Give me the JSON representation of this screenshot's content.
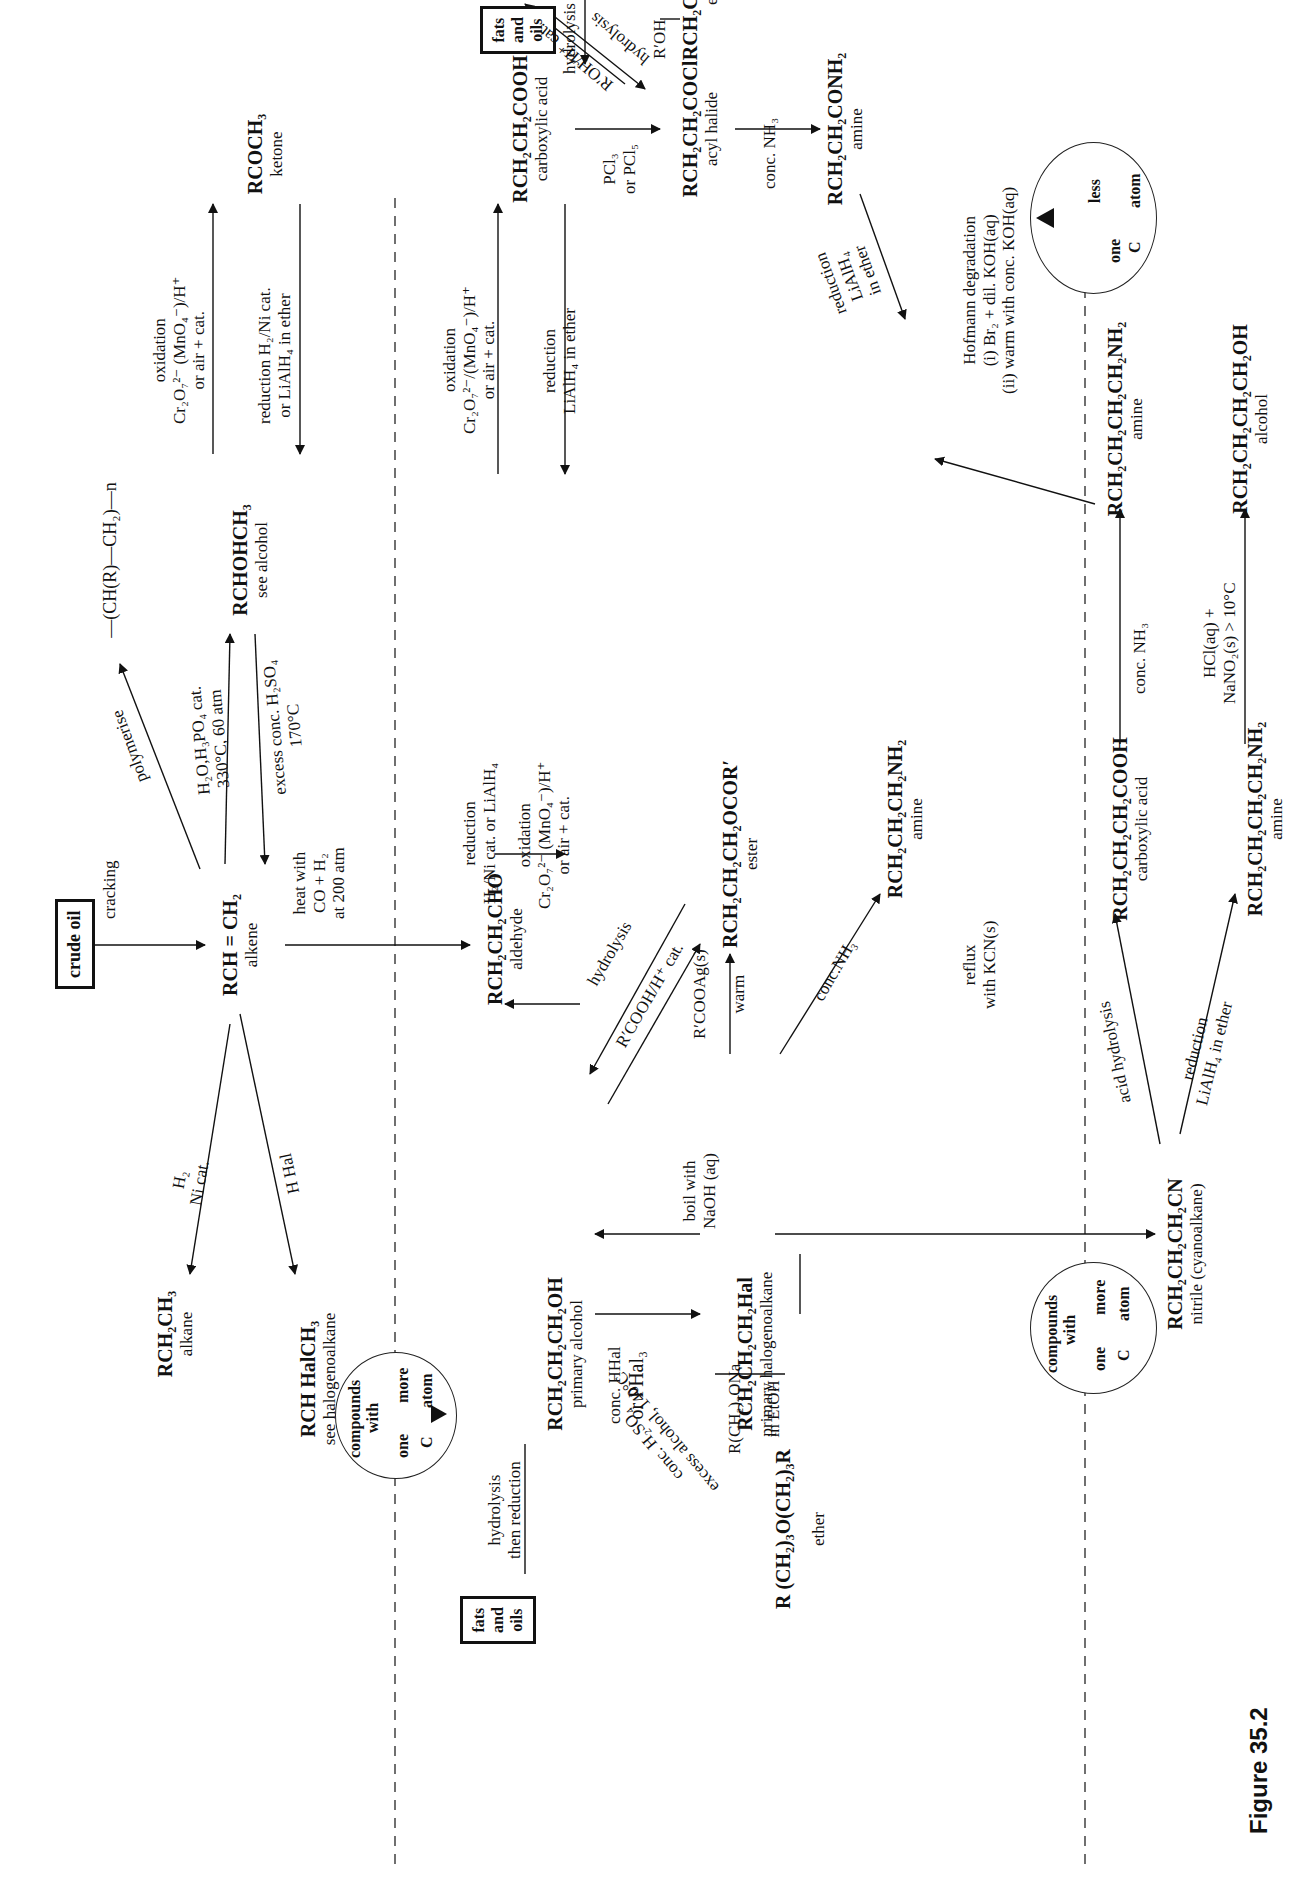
{
  "figure": {
    "caption": "Figure 35.2",
    "legend_more": {
      "top": "compounds",
      "mid": "with",
      "one": "one",
      "more": "more",
      "c": "C",
      "atom": "atom"
    },
    "legend_less": {
      "one": "one",
      "less": "less",
      "c": "C",
      "atom": "atom"
    },
    "boxes": {
      "crude_oil": "crude oil",
      "fats_oils_top": [
        "fats",
        "and",
        "oils"
      ],
      "fats_oils_bottom": [
        "fats",
        "and",
        "oils"
      ]
    }
  },
  "compounds": {
    "alkene": {
      "formula": "RCH = CH₂",
      "class": "alkene"
    },
    "polymer": {
      "formula": "—(CH(R)—CH₂)—n"
    },
    "sec_alcohol": {
      "formula": "RCHOHCH₃",
      "class": "see alcohol"
    },
    "ketone": {
      "formula": "RCOCH₃",
      "class": "ketone"
    },
    "alkane": {
      "formula": "RCH₂CH₃",
      "class": "alkane"
    },
    "halo_sec": {
      "formula": "RCH HalCH₃",
      "class": "see halogenoalkane"
    },
    "aldehyde": {
      "formula": "RCH₂CH₂CHO",
      "class": "aldehyde"
    },
    "carboxylic_acid": {
      "formula": "RCH₂CH₂COOH",
      "class": "carboxylic acid"
    },
    "ester_top": {
      "formula": "RCH₂CH₂CO₂R′",
      "class": "ester"
    },
    "acyl_halide": {
      "formula": "RCH₂CH₂COCl",
      "class": "acyl halide"
    },
    "amide": {
      "formula": "RCH₂CH₂CONH₂",
      "class": "amine"
    },
    "primary_alcohol": {
      "formula": "RCH₂CH₂CH₂OH",
      "class": "primary alcohol"
    },
    "ester_mid": {
      "formula": "RCH₂CH₂CH₂OCOR′",
      "class": "ester"
    },
    "amine_mid": {
      "formula": "RCH₂CH₂CH₂NH₂",
      "class": "amine"
    },
    "halogenoalkane": {
      "formula": "RCH₂CH₂CH₂Hal",
      "class": "primary halogenoalkane"
    },
    "ether": {
      "formula": "R (CH₂)₃O(CH₂)₃R",
      "class": "ether"
    },
    "nitrile": {
      "formula": "RCH₂CH₂CH₂CN",
      "class": "nitrile (cyanoalkane)"
    },
    "acid_low": {
      "formula": "RCH₂CH₂CH₂COOH",
      "class": "carboxylic acid"
    },
    "amine_low": {
      "formula": "RCH₂CH₂CH₂CH₂NH₂",
      "class": "amine"
    },
    "amine_top_right": {
      "formula": "RCH₂CH₂CH₂CH₂NH₂",
      "class": "amine"
    },
    "alcohol_top_right": {
      "formula": "RCH₂CH₂CH₂CH₂OH",
      "class": "alcohol"
    }
  },
  "reactions": {
    "cracking": "cracking",
    "polymerise": "polymerise",
    "hydration": [
      "H₂O,H₃PO₄ cat.",
      "330°C, 60 atm"
    ],
    "dehydration": [
      "excess conc. H₂SO₄",
      "170°C"
    ],
    "ketone_ox": [
      "oxidation",
      "Cr₂O₇²⁻ (MnO₄⁻)/H⁺",
      "or air + cat."
    ],
    "ketone_red": [
      "reduction H₂/Ni cat.",
      "or LiAlH₄ in ether"
    ],
    "hydrogenation": [
      "H₂",
      "Ni cat."
    ],
    "hydrohalogenation": "H Hal",
    "hydroformylation": [
      "heat with",
      "CO + H₂",
      "at 200 atm"
    ],
    "ald_acid_ox": [
      "oxidation",
      "Cr₂O₇²⁻/(MnO₄⁻)/H⁺",
      "or air + cat."
    ],
    "ald_acid_red": [
      "reduction",
      "LiAlH₄ in ether"
    ],
    "acid_hydrolysis_fats": "hydrolysis",
    "esterification_top": "R′OH/H⁺ cat.",
    "ester_hydrolysis_top": "hydrolysis",
    "acyl_to_ester": "R′OH",
    "acid_to_acyl": [
      "PCl₃",
      "or PCl₅"
    ],
    "acyl_to_amide": "conc. NH₃",
    "alc_ald_red": [
      "reduction",
      "H₂/Ni cat. or LiAlH₄"
    ],
    "alc_ald_ox": [
      "oxidation",
      "Cr₂O₇²⁻ (MnO₄⁻)/H⁺",
      "or air + cat."
    ],
    "ester_hydrolysis_mid": "hydrolysis",
    "esterification_mid": "R′COOH/H⁺ cat.",
    "silver_salt": [
      "R′COOAg(s)",
      "warm"
    ],
    "halo_to_alc": [
      "boil with",
      "NaOH (aq)"
    ],
    "alc_to_halo": [
      "conc. HHal",
      "or PHal₃"
    ],
    "williamson": [
      "R(CH₂)₃ONa",
      "in   EtOH"
    ],
    "ether_formation": [
      "conc. H₂SO₄",
      "excess alcohol, 140°C"
    ],
    "fats_to_alc": [
      "hydrolysis",
      "then reduction"
    ],
    "halo_to_amine": "conc.NH₃",
    "amide_red": [
      "reduction",
      "LiAlH₄",
      "in ether"
    ],
    "hofmann": [
      "Hofmann degradation",
      "(i) Br₂ + dil. KOH(aq)",
      "(ii) warm with conc. KOH(aq)"
    ],
    "nitrile_formation": [
      "reflux",
      "with KCN(s)"
    ],
    "nitrile_hydrolysis": "acid hydrolysis",
    "nitrile_red": [
      "reduction",
      "LiAlH₄ in ether"
    ],
    "acid_to_amine": "conc. NH₃",
    "diazotisation": [
      "HCl(aq) +",
      "NaNO₂(s) > 10°C"
    ]
  }
}
